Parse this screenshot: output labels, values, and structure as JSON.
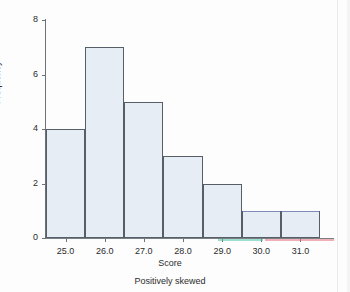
{
  "caption": "Positively skewed",
  "colors": {
    "bar_fill": "#e6edf4",
    "bar_border": "#565f68",
    "axis": "#6b7278",
    "text": "#2b2b2b",
    "background": "#fdfdfd",
    "fringe_blue": "#8f9ad8",
    "fringe_teal": "#4fc4a8",
    "fringe_red": "#e8707f"
  },
  "chart_data": {
    "type": "bar",
    "title": "",
    "subtitle": "",
    "xlabel": "Score",
    "ylabel": "Frequency",
    "categories": [
      "25.0",
      "26.0",
      "27.0",
      "28.0",
      "29.0",
      "30.0",
      "31.0"
    ],
    "values": [
      4,
      7,
      5,
      3,
      2,
      1,
      1
    ],
    "xtick_labels": [
      "25.0",
      "26.0",
      "27.0",
      "28.0",
      "29.0",
      "30.0",
      "31.0"
    ],
    "ytick_labels": [
      "0",
      "2",
      "4",
      "6",
      "8"
    ],
    "ytick_values": [
      0,
      2,
      4,
      6,
      8
    ],
    "ylim": [
      0,
      8
    ],
    "grid": false,
    "legend": null,
    "annotations": [
      "Positively skewed"
    ]
  }
}
